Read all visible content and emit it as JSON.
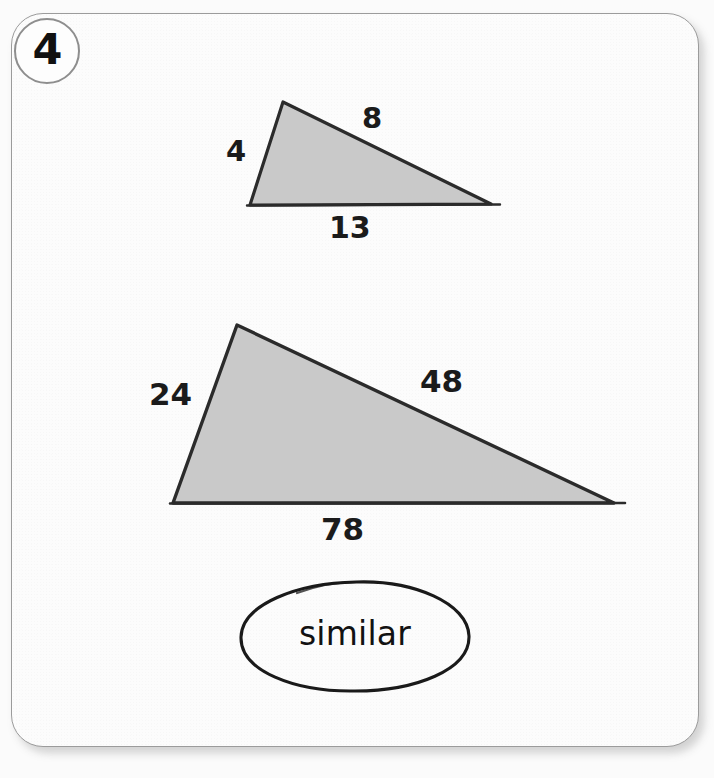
{
  "problem": {
    "number": "4",
    "answer": "similar"
  },
  "figures": [
    {
      "name": "small-triangle",
      "labels": {
        "left_side": "4",
        "hypotenuse": "8",
        "base": "13"
      }
    },
    {
      "name": "large-triangle",
      "labels": {
        "left_side": "24",
        "hypotenuse": "48",
        "base": "78"
      }
    }
  ],
  "colors": {
    "page_background": "#fbfbfb",
    "card_background": "#fcfcfc",
    "card_border": "#9b9b9b",
    "triangle_fill": "#c9c9c9",
    "triangle_stroke": "#2b2b2b",
    "ink": "#1b1b1b"
  }
}
